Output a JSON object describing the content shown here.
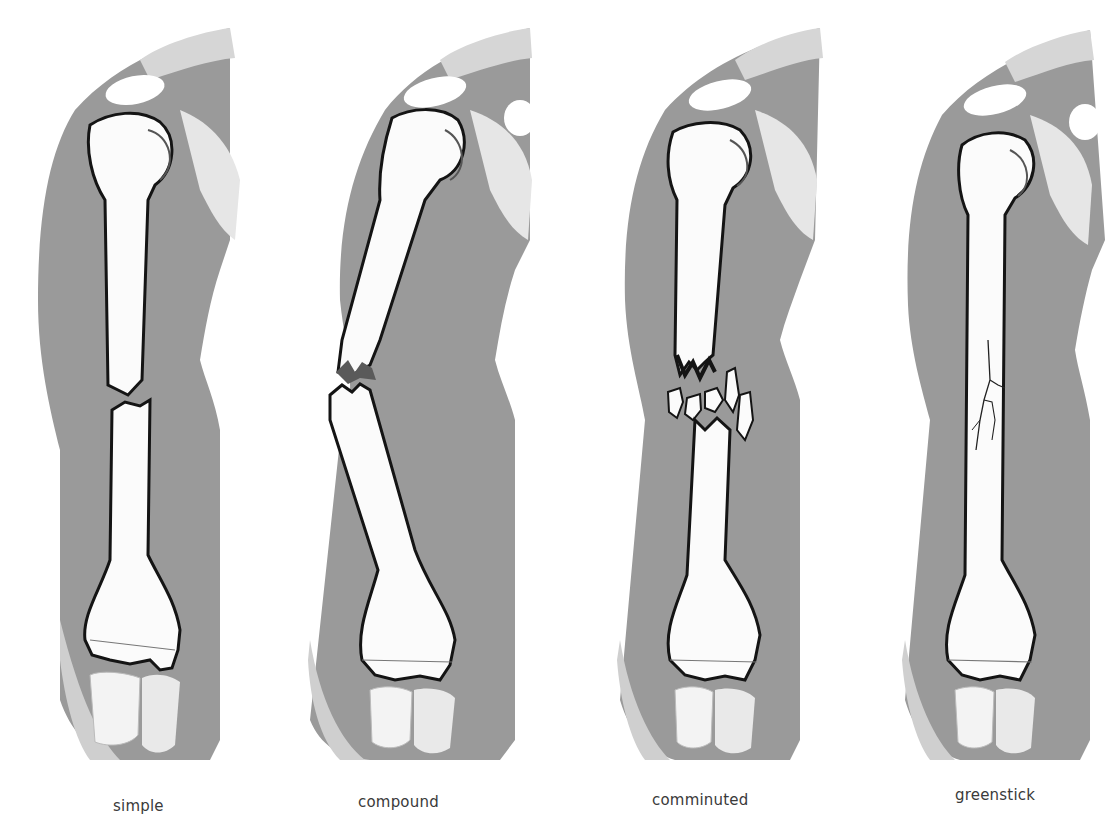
{
  "figure": {
    "colors": {
      "background": "#ffffff",
      "soft_tissue": "#9a9a9a",
      "soft_tissue_light": "#cfcfcf",
      "bone": "#fbfbfb",
      "bone_outline": "#141414",
      "caption_text": "#3a3a3a"
    },
    "panels": [
      {
        "id": "simple",
        "label": "simple",
        "fracture": "clean transverse break through shaft, ends separated"
      },
      {
        "id": "compound",
        "label": "compound",
        "fracture": "oblique jagged break with displaced ends"
      },
      {
        "id": "comminuted",
        "label": "comminuted",
        "fracture": "shaft shattered into multiple fragments"
      },
      {
        "id": "greenstick",
        "label": "greenstick",
        "fracture": "incomplete break with cracks on one side of shaft"
      }
    ]
  }
}
